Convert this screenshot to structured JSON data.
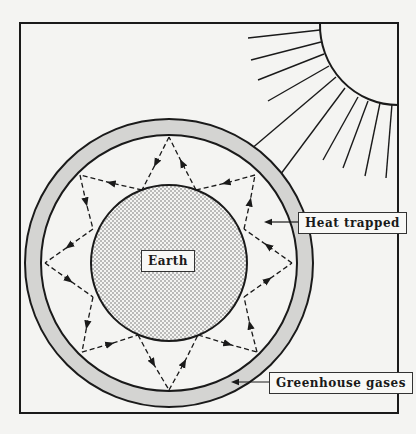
{
  "diagram": {
    "labels": {
      "earth": "Earth",
      "heat_trapped": "Heat trapped",
      "greenhouse_gases": "Greenhouse gases"
    },
    "colors": {
      "background": "#f4f4f2",
      "line": "#1a1a1a",
      "atmosphere_fill": "#d4d4d2",
      "earth_dots": "#555555"
    },
    "elements": [
      "sun",
      "sun-rays",
      "greenhouse-gas-layer",
      "earth",
      "reflected-heat-arrows"
    ]
  }
}
